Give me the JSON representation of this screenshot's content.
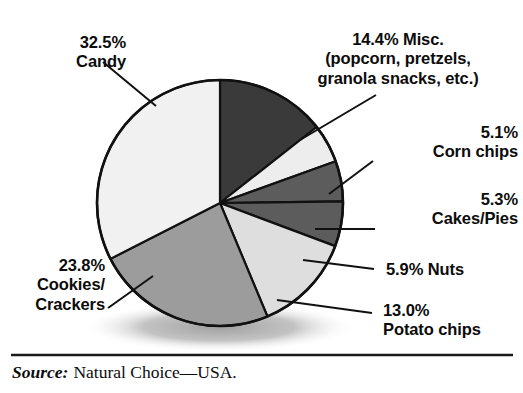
{
  "chart_data": {
    "type": "pie",
    "title": "",
    "subtitle": "",
    "xlabel": "",
    "ylabel": "",
    "legend_position": "callout-labels",
    "grid": false,
    "units": "percent",
    "total": 100.0,
    "categories": [
      "Misc. (popcorn, pretzels, granola snacks, etc.)",
      "Corn chips",
      "Cakes/Pies",
      "Nuts",
      "Potato chips",
      "Cookies/Crackers",
      "Candy"
    ],
    "values": [
      14.4,
      5.1,
      5.3,
      5.9,
      13.0,
      23.8,
      32.5
    ],
    "slices": [
      {
        "name": "misc",
        "value": 14.4,
        "value_text": "14.4%",
        "label_text": "14.4% Misc.\n(popcorn, pretzels,\ngranola snacks, etc.)",
        "fill": "#3a3a3a",
        "start_deg": 0.0,
        "end_deg": 51.84
      },
      {
        "name": "corn-chips",
        "value": 5.1,
        "value_text": "5.1%",
        "label_text": "5.1%\nCorn chips",
        "fill": "#ededed",
        "start_deg": 51.84,
        "end_deg": 70.2
      },
      {
        "name": "cakes-pies",
        "value": 5.3,
        "value_text": "5.3%",
        "label_text": "5.3%\nCakes/Pies",
        "fill": "#5c5c5c",
        "start_deg": 70.2,
        "end_deg": 89.28
      },
      {
        "name": "nuts",
        "value": 5.9,
        "value_text": "5.9%",
        "label_text": "5.9% Nuts",
        "fill": "#5c5c5c",
        "start_deg": 89.28,
        "end_deg": 110.52
      },
      {
        "name": "potato-chips",
        "value": 13.0,
        "value_text": "13.0%",
        "label_text": "13.0%\nPotato chips",
        "fill": "#dedede",
        "start_deg": 110.52,
        "end_deg": 157.32
      },
      {
        "name": "cookies-crackers",
        "value": 23.8,
        "value_text": "23.8%",
        "label_text": "23.8%\nCookies/\nCrackers",
        "fill": "#9c9c9c",
        "start_deg": 157.32,
        "end_deg": 242.99
      },
      {
        "name": "candy",
        "value": 32.5,
        "value_text": "32.5%",
        "label_text": "32.5%\nCandy",
        "fill": "#f1f1f1",
        "start_deg": 242.99,
        "end_deg": 360.0
      }
    ]
  },
  "colors": {
    "outline": "#111111",
    "leader_line": "#111111",
    "text": "#0c0c0c",
    "shadow": "#b3b3b3",
    "rule": "#1a1a1a",
    "background": "#ffffff"
  },
  "source": {
    "label": "Source:",
    "text": "Natural Choice—USA."
  }
}
